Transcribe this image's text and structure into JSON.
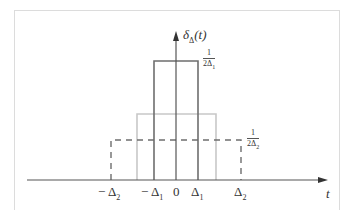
{
  "diagram": {
    "y_label": {
      "symbol": "δ",
      "subscript": "Δ",
      "arg": "(t)"
    },
    "x_label": "t",
    "ticks": [
      {
        "id": "neg_delta2",
        "sign": "−",
        "base": "Δ",
        "sub": "2",
        "x": 111
      },
      {
        "id": "neg_delta1",
        "sign": "−",
        "base": "Δ",
        "sub": "1",
        "x": 154
      },
      {
        "id": "zero",
        "sign": "",
        "base": "0",
        "sub": "",
        "x": 176
      },
      {
        "id": "delta1",
        "sign": "",
        "base": "Δ",
        "sub": "1",
        "x": 198
      },
      {
        "id": "delta2",
        "sign": "",
        "base": "Δ",
        "sub": "2",
        "x": 241
      }
    ],
    "heights": {
      "tall": {
        "num": "1",
        "den": "2Δ",
        "den_sub": "1"
      },
      "short": {
        "num": "1",
        "den": "2Δ",
        "den_sub": "2"
      }
    },
    "pulses": [
      {
        "name": "narrow-pulse",
        "x1": 154,
        "x2": 198,
        "top": 61,
        "style": "solid",
        "color": "#6e6e6e"
      },
      {
        "name": "medium-pulse",
        "x1": 137,
        "x2": 216,
        "top": 114,
        "style": "solid",
        "color": "#c8c8c8"
      },
      {
        "name": "wide-pulse",
        "x1": 111,
        "x2": 241,
        "top": 140,
        "style": "dashed",
        "color": "#6e6e6e"
      }
    ],
    "colors": {
      "axis": "#555555",
      "frame": "#dcdcdc"
    }
  }
}
